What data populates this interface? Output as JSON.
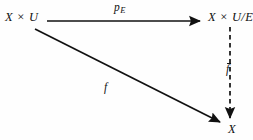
{
  "diagram": {
    "background_color": "#fefefe",
    "ink_color": "#111111",
    "nodes": [
      {
        "id": "source",
        "label": "X × U",
        "position": "top-left"
      },
      {
        "id": "quotient",
        "label": "X × U/E",
        "position": "top-right"
      },
      {
        "id": "target",
        "label": "X",
        "position": "bottom-right"
      }
    ],
    "edges": [
      {
        "id": "projection",
        "from": "source",
        "to": "quotient",
        "label_base": "p",
        "label_sub": "E",
        "style": "solid",
        "arrowhead": "filled-triangle",
        "direction": "horizontal-right"
      },
      {
        "id": "map",
        "from": "source",
        "to": "target",
        "label": "f",
        "style": "solid",
        "arrowhead": "filled-triangle",
        "direction": "diagonal-down-right"
      },
      {
        "id": "induced",
        "from": "quotient",
        "to": "target",
        "label": "f",
        "label_decoration": "overbar",
        "style": "dashed",
        "arrowhead": "filled-triangle",
        "direction": "vertical-down"
      }
    ]
  }
}
